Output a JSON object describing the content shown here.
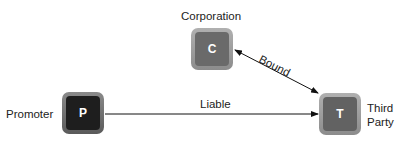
{
  "nodes": {
    "promoter": {
      "letter": "P",
      "label": "Promoter"
    },
    "corporation": {
      "letter": "C",
      "label": "Corporation"
    },
    "third_party": {
      "letter": "T",
      "label_line1": "Third",
      "label_line2": "Party"
    }
  },
  "edges": {
    "liable": {
      "label": "Liable",
      "from": "Promoter",
      "to": "Third Party",
      "direction": "one-way"
    },
    "bound": {
      "label": "Bound",
      "from": "Corporation",
      "to": "Third Party",
      "direction": "two-way"
    }
  }
}
